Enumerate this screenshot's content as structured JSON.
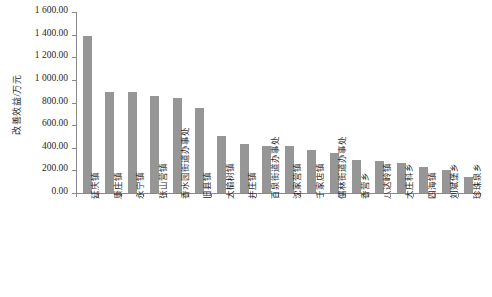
{
  "chart_data": {
    "type": "bar",
    "title": "",
    "xlabel": "",
    "ylabel": "改善效益/万元",
    "ylim": [
      0,
      1600
    ],
    "ytick_values": [
      1600,
      1400,
      1200,
      1000,
      800,
      600,
      400,
      200,
      0
    ],
    "ytick_labels": [
      "1 600.00",
      "1 400.00",
      "1 200.00",
      "1 000.00",
      "800.00",
      "600.00",
      "400.00",
      "200.00",
      "0.00"
    ],
    "grid": false,
    "legend": "none",
    "bar_color": "#969696",
    "axis_color": "#8a8a8a",
    "categories": [
      "延庆镇",
      "康庄镇",
      "永宁镇",
      "张山营镇",
      "香水园街道办事处",
      "旧县镇",
      "大榆树镇",
      "井庄镇",
      "百泉街道办事处",
      "沈家营镇",
      "千家店镇",
      "儒林街道办事处",
      "香营乡",
      "八达岭镇",
      "大庄科乡",
      "四海镇",
      "刘斌堡乡",
      "珍珠泉乡"
    ],
    "values": [
      1390.0,
      895.0,
      895.0,
      855.0,
      840.0,
      750.0,
      505.0,
      435.0,
      420.0,
      415.0,
      380.0,
      350.0,
      295.0,
      285.0,
      265.0,
      230.0,
      200.0,
      140.0
    ]
  }
}
